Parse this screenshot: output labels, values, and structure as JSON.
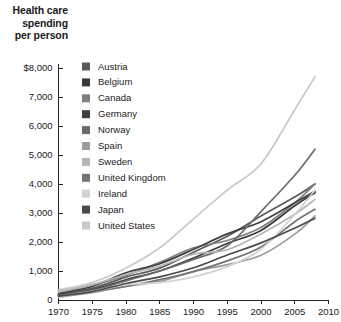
{
  "figure": {
    "title_lines": [
      "Health care",
      "spending",
      "per person"
    ],
    "background_color": "#ffffff",
    "text_color": "#1a1a1a",
    "axis_color": "#222222"
  },
  "chart_data": {
    "type": "line",
    "title": "Health care spending per person",
    "xlabel": "",
    "ylabel": "Health care spending per person",
    "xlim": [
      1970,
      2010
    ],
    "ylim": [
      0,
      8000
    ],
    "grid": false,
    "legend_position": "inside-top-left",
    "x_tick_labels": [
      "1970",
      "1975",
      "1980",
      "1985",
      "1990",
      "1995",
      "2000",
      "2005",
      "2010"
    ],
    "x_ticks": [
      1970,
      1975,
      1980,
      1985,
      1990,
      1995,
      2000,
      2005,
      2010
    ],
    "y_tick_labels": [
      "0",
      "1,000",
      "2,000",
      "3,000",
      "4,000",
      "5,000",
      "6,000",
      "7,000",
      "$8,000"
    ],
    "y_ticks": [
      0,
      1000,
      2000,
      3000,
      4000,
      5000,
      6000,
      7000,
      8000
    ],
    "x": [
      1970,
      1975,
      1980,
      1985,
      1990,
      1995,
      2000,
      2005,
      2008
    ],
    "series": [
      {
        "name": "Austria",
        "color": "#5a5a5a",
        "values": [
          190,
          400,
          790,
          1100,
          1650,
          2200,
          2900,
          3550,
          4000
        ]
      },
      {
        "name": "Belgium",
        "color": "#3a3a3a",
        "values": [
          150,
          350,
          700,
          1000,
          1450,
          1950,
          2400,
          3250,
          3700
        ]
      },
      {
        "name": "Canada",
        "color": "#808080",
        "values": [
          280,
          520,
          850,
          1300,
          1800,
          2050,
          2500,
          3350,
          4000
        ]
      },
      {
        "name": "Germany",
        "color": "#3f3f3f",
        "values": [
          220,
          470,
          940,
          1250,
          1750,
          2280,
          2700,
          3350,
          3750
        ]
      },
      {
        "name": "Norway",
        "color": "#6b6b6b",
        "values": [
          140,
          330,
          660,
          1000,
          1400,
          1870,
          3050,
          4300,
          5200
        ]
      },
      {
        "name": "Spain",
        "color": "#9e9e9e",
        "values": [
          95,
          250,
          470,
          640,
          980,
          1220,
          1540,
          2270,
          2900
        ]
      },
      {
        "name": "Sweden",
        "color": "#b5b5b5",
        "values": [
          280,
          520,
          880,
          1170,
          1580,
          1730,
          2280,
          2960,
          3470
        ]
      },
      {
        "name": "United Kingdom",
        "color": "#747474",
        "values": [
          155,
          300,
          470,
          700,
          980,
          1350,
          1830,
          2700,
          3130
        ]
      },
      {
        "name": "Ireland",
        "color": "#d2d2d2",
        "values": [
          110,
          300,
          520,
          600,
          800,
          1150,
          1750,
          2950,
          3790
        ]
      },
      {
        "name": "Japan",
        "color": "#4a4a4a",
        "values": [
          130,
          290,
          570,
          800,
          1110,
          1550,
          1970,
          2480,
          2820
        ]
      },
      {
        "name": "United States",
        "color": "#c9c9c9",
        "values": [
          350,
          600,
          1100,
          1800,
          2800,
          3790,
          4700,
          6560,
          7700
        ]
      }
    ]
  }
}
